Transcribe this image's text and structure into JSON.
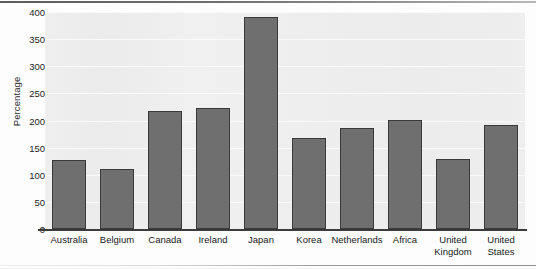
{
  "chart_data": {
    "type": "bar",
    "title": "",
    "xlabel": "",
    "ylabel": "Percentage",
    "ylim": [
      0,
      400
    ],
    "ytick_step": 50,
    "yticks": [
      0,
      50,
      100,
      150,
      200,
      250,
      300,
      350,
      400
    ],
    "grid": true,
    "legend": false,
    "bar_color": "#6f6f6f",
    "bar_edge_color": "#3a3a3a",
    "plot_background": "#eeeeee",
    "categories": [
      "Australia",
      "Belgium",
      "Canada",
      "Ireland",
      "Japan",
      "Korea",
      "Netherlands",
      "Africa",
      "United Kingdom",
      "United States"
    ],
    "category_lines": [
      [
        "Australia"
      ],
      [
        "Belgium"
      ],
      [
        "Canada"
      ],
      [
        "Ireland"
      ],
      [
        "Japan"
      ],
      [
        "Korea"
      ],
      [
        "Netherlands"
      ],
      [
        "Africa"
      ],
      [
        "United",
        "Kingdom"
      ],
      [
        "United",
        "States"
      ]
    ],
    "values": [
      127,
      110,
      218,
      223,
      391,
      168,
      187,
      201,
      129,
      192
    ]
  }
}
